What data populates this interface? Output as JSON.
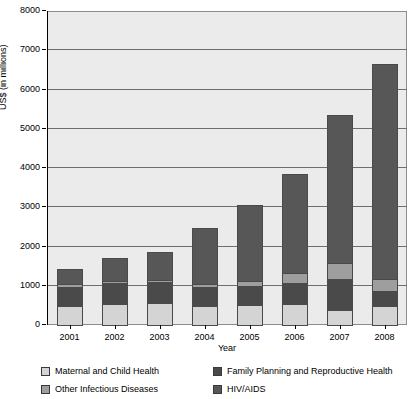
{
  "chart_data": {
    "type": "bar",
    "subtype": "stacked-vertical",
    "title": "",
    "xlabel": "Year",
    "ylabel": "US$ (in millions)",
    "categories": [
      "2001",
      "2002",
      "2003",
      "2004",
      "2005",
      "2006",
      "2007",
      "2008"
    ],
    "ylim": [
      0,
      8000
    ],
    "ytick_values": [
      0,
      1000,
      2000,
      3000,
      4000,
      5000,
      6000,
      7000,
      8000
    ],
    "ytick_labels": [
      "0",
      "1000",
      "2000",
      "3000",
      "4000",
      "5000",
      "6000",
      "7000",
      "8000"
    ],
    "grid": true,
    "grid_axis": "y",
    "legend_position": "bottom",
    "series": [
      {
        "name": "Maternal and Child Health",
        "color": "#d4d4d4",
        "values": [
          520,
          570,
          580,
          520,
          530,
          560,
          400,
          500
        ]
      },
      {
        "name": "Family Planning and Reproductive Health",
        "color": "#4a4a4a",
        "values": [
          510,
          560,
          560,
          510,
          510,
          560,
          830,
          430
        ]
      },
      {
        "name": "Other Infectious Diseases",
        "color": "#9e9e9e",
        "values": [
          90,
          80,
          90,
          90,
          150,
          280,
          430,
          330
        ]
      },
      {
        "name": "HIV/AIDS",
        "color": "#575757",
        "values": [
          410,
          590,
          730,
          1460,
          1960,
          2540,
          3790,
          5490
        ]
      }
    ],
    "totals": [
      1530,
      1800,
      1960,
      2580,
      3150,
      3940,
      5450,
      6750
    ]
  }
}
